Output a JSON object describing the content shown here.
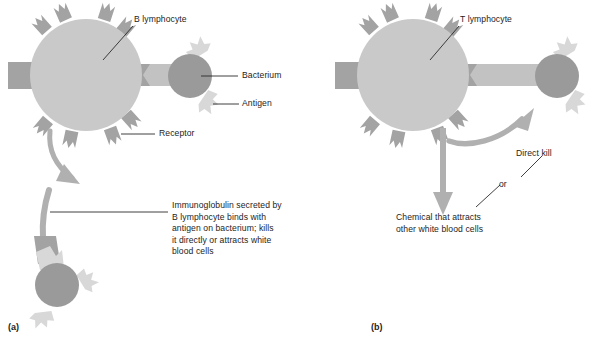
{
  "figure": {
    "type": "biology-diagram",
    "panels": [
      {
        "id": "a",
        "id_label": "(a)",
        "title": "B lymphocyte response",
        "labels": {
          "cell": "B lymphocyte",
          "bacterium": "Bacterium",
          "antigen": "Antigen",
          "receptor": "Receptor",
          "caption": "Immunoglobulin secreted by\nB lymphocyte binds with\nantigen on bacterium; kills\nit directly or attracts white\nblood cells"
        }
      },
      {
        "id": "b",
        "id_label": "(b)",
        "title": "T lymphocyte response",
        "labels": {
          "cell": "T lymphocyte",
          "direct_kill": "Direct kill",
          "or": "or",
          "chemical": "Chemical that attracts\nother white blood cells"
        }
      }
    ]
  },
  "colors": {
    "lymphocyte_body": "#c9c9c9",
    "receptor": "#a3a3a3",
    "bacterium": "#9a9a9a",
    "antigen": "#d8d8d8",
    "bridge": "#c2c2c2",
    "arrow": "#b0b0b0",
    "leader_line": "#2b2b2b",
    "text": "#1d1d1d",
    "background": "#ffffff"
  },
  "icons": {
    "curved_arrow": "curved-arrow-icon",
    "down_arrow": "down-arrow-icon",
    "receptor_spike": "receptor-spike-icon",
    "antigen_spike": "antigen-spike-icon"
  }
}
